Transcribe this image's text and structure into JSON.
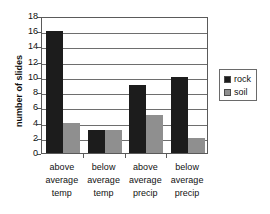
{
  "chart_data": {
    "type": "bar",
    "title": "",
    "subtitle": "",
    "xlabel": "",
    "ylabel": "number of slides",
    "ylim": [
      0,
      18
    ],
    "ytick_step": 2,
    "yticks": [
      0,
      2,
      4,
      6,
      8,
      10,
      12,
      14,
      16,
      18
    ],
    "ytick_labels": [
      "0",
      "2",
      "4",
      "6",
      "8",
      "10",
      "12",
      "14",
      "16",
      "18"
    ],
    "grid": true,
    "grid_axis": "y",
    "legend_position": "right",
    "categories": [
      "above average temp",
      "below average temp",
      "above average precip",
      "below average precip"
    ],
    "category_lines": [
      [
        "above",
        "average",
        "temp"
      ],
      [
        "below",
        "average",
        "temp"
      ],
      [
        "above",
        "average",
        "precip"
      ],
      [
        "below",
        "average",
        "precip"
      ]
    ],
    "series": [
      {
        "name": "rock",
        "color": "#1c1c1c",
        "values": [
          16,
          3,
          9,
          10
        ]
      },
      {
        "name": "soil",
        "color": "#8f8f8f",
        "values": [
          4,
          3,
          5,
          2
        ]
      }
    ],
    "annotations": []
  },
  "legend": {
    "entries": [
      {
        "label": "rock",
        "swatch": "rock-swatch"
      },
      {
        "label": "soil",
        "swatch": "soil-swatch"
      }
    ]
  },
  "colors": {
    "rock": "#1c1c1c",
    "soil": "#8f8f8f",
    "axis": "#5a5a5a",
    "grid": "#6e6e6e",
    "background": "#ffffff",
    "text": "#111111"
  }
}
